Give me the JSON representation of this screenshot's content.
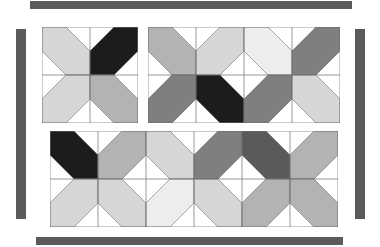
{
  "page": {
    "background_color": "#ffffff",
    "width": 380,
    "height": 247
  },
  "palette": {
    "bar": "#5a5a5a",
    "outline": "#6e6e6e",
    "white": "#ffffff",
    "light": "#ededed",
    "light_gray": "#d6d6d6",
    "mid_gray": "#b3b3b3",
    "dark_gray": "#7f7f7f",
    "black": "#1c1c1c"
  },
  "bars": [
    {
      "name": "top-bar",
      "x": 30,
      "y": 1,
      "w": 322,
      "h": 8,
      "color": "#5a5a5a"
    },
    {
      "name": "left-bar",
      "x": 16,
      "y": 29,
      "w": 10,
      "h": 190,
      "color": "#5a5a5a"
    },
    {
      "name": "right-bar",
      "x": 355,
      "y": 29,
      "w": 10,
      "h": 190,
      "color": "#5a5a5a"
    },
    {
      "name": "bottom-bar",
      "x": 36,
      "y": 237,
      "w": 307,
      "h": 8,
      "color": "#5a5a5a"
    }
  ],
  "blocks": [
    {
      "name": "block-top-left",
      "label": "Two by Two Block",
      "x": 42,
      "y": 27,
      "cell": 48,
      "cols": 2,
      "rows": 2,
      "cells": [
        {
          "r": 0,
          "c": 0,
          "dir": "se",
          "color": "#d6d6d6"
        },
        {
          "r": 0,
          "c": 1,
          "dir": "sw",
          "color": "#1c1c1c"
        },
        {
          "r": 1,
          "c": 0,
          "dir": "ne",
          "color": "#d6d6d6"
        },
        {
          "r": 1,
          "c": 1,
          "dir": "nw",
          "color": "#b3b3b3"
        }
      ]
    },
    {
      "name": "block-top-right",
      "label": "Four by Two Block",
      "x": 148,
      "y": 27,
      "cell": 48,
      "cols": 4,
      "rows": 2,
      "cells": [
        {
          "r": 0,
          "c": 0,
          "dir": "se",
          "color": "#b3b3b3"
        },
        {
          "r": 0,
          "c": 1,
          "dir": "sw",
          "color": "#d6d6d6"
        },
        {
          "r": 0,
          "c": 2,
          "dir": "se",
          "color": "#ededed"
        },
        {
          "r": 0,
          "c": 3,
          "dir": "sw",
          "color": "#7f7f7f"
        },
        {
          "r": 1,
          "c": 0,
          "dir": "ne",
          "color": "#7f7f7f"
        },
        {
          "r": 1,
          "c": 1,
          "dir": "nw",
          "color": "#1c1c1c"
        },
        {
          "r": 1,
          "c": 2,
          "dir": "ne",
          "color": "#7f7f7f"
        },
        {
          "r": 1,
          "c": 3,
          "dir": "nw",
          "color": "#d6d6d6"
        }
      ]
    },
    {
      "name": "block-bottom",
      "label": "Six by Two Block",
      "x": 50,
      "y": 131,
      "cell": 48,
      "cols": 6,
      "rows": 2,
      "cells": [
        {
          "r": 0,
          "c": 0,
          "dir": "se",
          "color": "#1c1c1c"
        },
        {
          "r": 0,
          "c": 1,
          "dir": "sw",
          "color": "#b3b3b3"
        },
        {
          "r": 0,
          "c": 2,
          "dir": "se",
          "color": "#d6d6d6"
        },
        {
          "r": 0,
          "c": 3,
          "dir": "sw",
          "color": "#7f7f7f"
        },
        {
          "r": 0,
          "c": 4,
          "dir": "se",
          "color": "#5a5a5a"
        },
        {
          "r": 0,
          "c": 5,
          "dir": "sw",
          "color": "#b3b3b3"
        },
        {
          "r": 1,
          "c": 0,
          "dir": "ne",
          "color": "#d6d6d6"
        },
        {
          "r": 1,
          "c": 1,
          "dir": "nw",
          "color": "#d6d6d6"
        },
        {
          "r": 1,
          "c": 2,
          "dir": "ne",
          "color": "#ededed"
        },
        {
          "r": 1,
          "c": 3,
          "dir": "nw",
          "color": "#d6d6d6"
        },
        {
          "r": 1,
          "c": 4,
          "dir": "ne",
          "color": "#b3b3b3"
        },
        {
          "r": 1,
          "c": 5,
          "dir": "nw",
          "color": "#b3b3b3"
        }
      ]
    }
  ]
}
